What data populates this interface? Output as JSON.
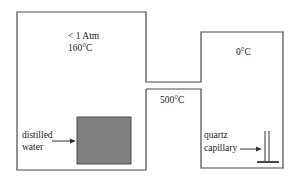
{
  "diagram": {
    "regions": {
      "left_chamber": {
        "line1": "< 1 Atm",
        "line2": "160°C"
      },
      "middle_section": {
        "label": "500°C"
      },
      "right_chamber": {
        "label": "0°C"
      }
    },
    "callouts": {
      "water": {
        "line1": "distilled",
        "line2": "water"
      },
      "capillary": {
        "line1": "quartz",
        "line2": "capillary"
      }
    },
    "colors": {
      "line": "#4a4a4a",
      "water_fill": "#7f7f7f",
      "water_border": "#4f4f4f"
    }
  }
}
